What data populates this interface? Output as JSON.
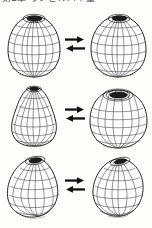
{
  "header": {
    "text": "第2章 ランビルバイ量",
    "clipped": true
  },
  "figure": {
    "caption": "",
    "background_color": "#fdfdfc",
    "ink_color": "#262626",
    "mesh_color": "#3a3a3a",
    "rows": [
      {
        "row_label": "row-1",
        "relation_symbol": "⇌",
        "relation_name": "double-arrow-equilibrium",
        "left": {
          "name": "ellipsoid-upright",
          "description": "upright prolate ellipsoid wireframe with dark polar cap",
          "cap": "dark-elliptical-opening"
        },
        "right": {
          "name": "ellipsoid-rounded",
          "description": "slightly rounder ellipsoid wireframe with dark polar cap",
          "cap": "dark-elliptical-opening"
        }
      },
      {
        "row_label": "row-2",
        "relation_symbol": "⇌",
        "relation_name": "double-arrow-equilibrium",
        "left": {
          "name": "pear-dome",
          "description": "pear / dome shaped wireframe narrow at top wide at base",
          "cap": "small-dark-opening"
        },
        "right": {
          "name": "oblate-wide",
          "description": "wide rounded wireframe with large visible top opening",
          "cap": "large-dark-opening"
        }
      },
      {
        "row_label": "row-3",
        "relation_symbol": "⇌",
        "relation_name": "double-arrow-equilibrium",
        "left": {
          "name": "egg-tilted",
          "description": "tilted egg / teardrop wireframe",
          "cap": "dark-elliptical-opening"
        },
        "right": {
          "name": "rounded-tilted",
          "description": "tilted rounded wireframe, compressed vertically",
          "cap": "dark-slot-opening"
        }
      }
    ]
  }
}
